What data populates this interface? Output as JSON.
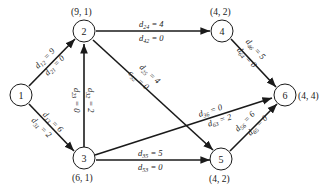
{
  "nodes": [
    {
      "id": "1",
      "label": "1",
      "coord": ""
    },
    {
      "id": "2",
      "label": "2",
      "coord": "(9, 1)"
    },
    {
      "id": "3",
      "label": "3",
      "coord": "(6, 1)"
    },
    {
      "id": "4",
      "label": "4",
      "coord": "(4, 2)"
    },
    {
      "id": "5",
      "label": "5",
      "coord": "(4, 2)"
    },
    {
      "id": "6",
      "label": "6",
      "coord": "(4, 4)"
    }
  ],
  "edges": [
    {
      "from": "1",
      "to": "2",
      "fwd": {
        "d": "d",
        "sub": "12",
        "val": " = 9"
      },
      "rev": {
        "d": "d",
        "sub": "21",
        "val": " = 0"
      }
    },
    {
      "from": "1",
      "to": "3",
      "fwd": {
        "d": "d",
        "sub": "13",
        "val": " = 6"
      },
      "rev": {
        "d": "d",
        "sub": "31",
        "val": " = 2"
      }
    },
    {
      "from": "3",
      "to": "2",
      "fwd": {
        "d": "d",
        "sub": "32",
        "val": " = 2"
      },
      "rev": {
        "d": "d",
        "sub": "23",
        "val": " = 0"
      }
    },
    {
      "from": "2",
      "to": "4",
      "fwd": {
        "d": "d",
        "sub": "24",
        "val": " = 4"
      },
      "rev": {
        "d": "d",
        "sub": "42",
        "val": " = 0"
      }
    },
    {
      "from": "2",
      "to": "5",
      "fwd": {
        "d": "d",
        "sub": "25",
        "val": " = 4"
      },
      "rev": {
        "d": "c",
        "sub": "52",
        "val": " = 0"
      }
    },
    {
      "from": "4",
      "to": "6",
      "fwd": {
        "d": "d",
        "sub": "46",
        "val": " = 5"
      },
      "rev": {
        "d": "d",
        "sub": "64",
        "val": " = 0"
      }
    },
    {
      "from": "3",
      "to": "6",
      "fwd": {
        "d": "d",
        "sub": "36",
        "val": " = 0"
      },
      "rev": {
        "d": "d",
        "sub": "63",
        "val": " = 2"
      }
    },
    {
      "from": "3",
      "to": "5",
      "fwd": {
        "d": "d",
        "sub": "35",
        "val": " = 5"
      },
      "rev": {
        "d": "d",
        "sub": "53",
        "val": " = 0"
      }
    },
    {
      "from": "5",
      "to": "6",
      "fwd": {
        "d": "d",
        "sub": "56",
        "val": " = 6"
      },
      "rev": {
        "d": "d",
        "sub": "65",
        "val": " = 0"
      }
    }
  ]
}
